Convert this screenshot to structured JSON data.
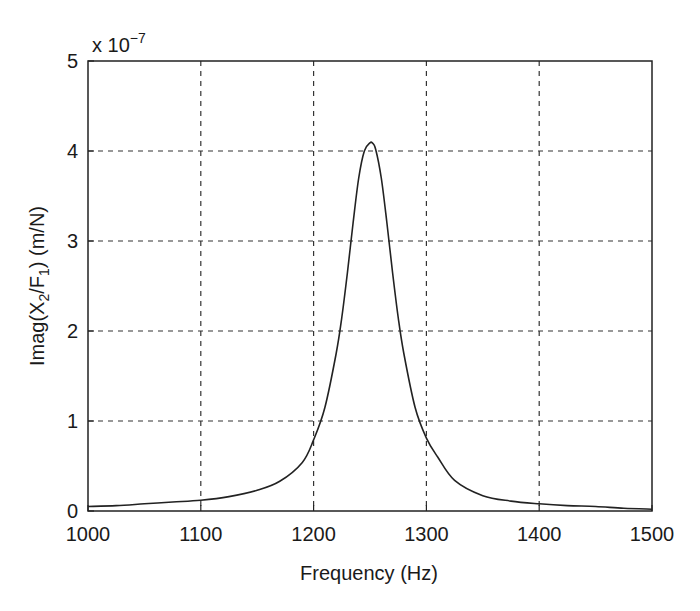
{
  "chart_data": {
    "type": "line",
    "title": "",
    "xlabel": "Frequency (Hz)",
    "ylabel": "Imag(X2/F1) (m/N)",
    "y_scale_label": "x 10^-7",
    "y_multiplier": 1e-07,
    "xlim": [
      1000,
      1500
    ],
    "ylim": [
      0,
      5
    ],
    "xticks": [
      1000,
      1100,
      1200,
      1300,
      1400,
      1500
    ],
    "yticks": [
      0,
      1,
      2,
      3,
      4,
      5
    ],
    "grid": true,
    "grid_style": "dashed",
    "legend": null,
    "series": [
      {
        "name": "Imag(X2/F1)",
        "color": "#222222",
        "x": [
          1000,
          1025,
          1050,
          1075,
          1100,
          1125,
          1150,
          1170,
          1190,
          1200,
          1210,
          1220,
          1225,
          1230,
          1235,
          1240,
          1245,
          1250,
          1252,
          1255,
          1260,
          1265,
          1270,
          1275,
          1280,
          1290,
          1300,
          1310,
          1325,
          1350,
          1375,
          1400,
          1425,
          1450,
          1475,
          1500
        ],
        "values": [
          0.05,
          0.06,
          0.08,
          0.1,
          0.12,
          0.16,
          0.23,
          0.33,
          0.54,
          0.79,
          1.15,
          1.75,
          2.15,
          2.65,
          3.2,
          3.7,
          4.0,
          4.09,
          4.09,
          4.02,
          3.7,
          3.2,
          2.65,
          2.15,
          1.75,
          1.15,
          0.81,
          0.6,
          0.34,
          0.17,
          0.11,
          0.08,
          0.06,
          0.05,
          0.03,
          0.02
        ]
      }
    ],
    "annotations": {
      "peak": {
        "x": 1252,
        "y": 4.09
      }
    }
  },
  "labels": {
    "xlabel": "Frequency (Hz)",
    "ylabel_main": "Imag(X",
    "ylabel_sub1": "2",
    "ylabel_mid": "/F",
    "ylabel_sub2": "1",
    "ylabel_end": ") (m/N)",
    "scale_prefix": "x 10",
    "scale_exp": "−7"
  }
}
